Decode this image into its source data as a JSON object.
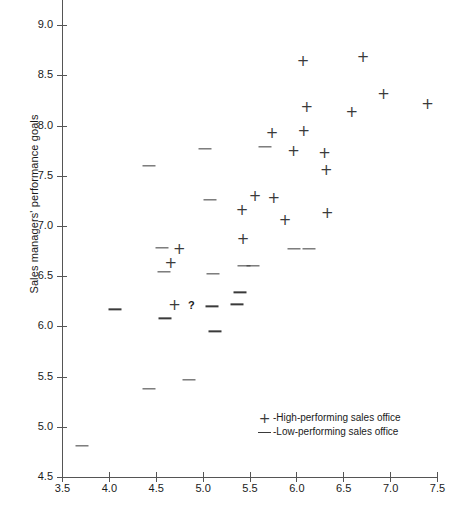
{
  "chart_data": {
    "type": "scatter",
    "title": "",
    "xlabel": "",
    "ylabel": "Sales managers' performance goals",
    "xlim": [
      3.5,
      7.5
    ],
    "ylim": [
      4.5,
      9.25
    ],
    "xticks": [
      "3.5",
      "4.0",
      "4.5",
      "5.0",
      "5.5",
      "6.0",
      "6.5",
      "7.0",
      "7.5"
    ],
    "xtick_values": [
      3.5,
      4.0,
      4.5,
      5.0,
      5.5,
      6.0,
      6.5,
      7.0,
      7.5
    ],
    "yticks": [
      "4.5",
      "5.0",
      "5.5",
      "6.0",
      "6.5",
      "7.0",
      "7.5",
      "8.0",
      "8.5",
      "9.0"
    ],
    "ytick_values": [
      4.5,
      5.0,
      5.5,
      6.0,
      6.5,
      7.0,
      7.5,
      8.0,
      8.5,
      9.0
    ],
    "grid": false,
    "legend_position": "lower-right",
    "annotations": [
      {
        "text": "?",
        "x": 4.78,
        "y": 6.21
      }
    ],
    "series": [
      {
        "name": "High-performing sales office",
        "marker": "+",
        "legend_label": "High-performing sales office",
        "points": [
          {
            "x": 4.66,
            "y": 6.63
          },
          {
            "x": 4.75,
            "y": 6.77
          },
          {
            "x": 4.7,
            "y": 6.21
          },
          {
            "x": 5.42,
            "y": 7.16
          },
          {
            "x": 5.43,
            "y": 6.87
          },
          {
            "x": 5.56,
            "y": 7.3
          },
          {
            "x": 5.74,
            "y": 7.93
          },
          {
            "x": 5.76,
            "y": 7.28
          },
          {
            "x": 5.88,
            "y": 7.06
          },
          {
            "x": 5.97,
            "y": 7.75
          },
          {
            "x": 6.07,
            "y": 8.64
          },
          {
            "x": 6.08,
            "y": 7.95
          },
          {
            "x": 6.11,
            "y": 8.18
          },
          {
            "x": 6.3,
            "y": 7.73
          },
          {
            "x": 6.32,
            "y": 7.56
          },
          {
            "x": 6.33,
            "y": 7.13
          },
          {
            "x": 6.59,
            "y": 8.13
          },
          {
            "x": 6.71,
            "y": 8.68
          },
          {
            "x": 6.93,
            "y": 8.31
          },
          {
            "x": 7.4,
            "y": 8.21
          }
        ]
      },
      {
        "name": "Low-performing sales office",
        "marker": "-",
        "legend_label": "Low-performing sales office",
        "points": [
          {
            "x": 3.71,
            "y": 4.81
          },
          {
            "x": 4.07,
            "y": 6.17
          },
          {
            "x": 4.43,
            "y": 5.38
          },
          {
            "x": 4.43,
            "y": 7.6
          },
          {
            "x": 4.57,
            "y": 6.78
          },
          {
            "x": 4.59,
            "y": 6.54
          },
          {
            "x": 4.6,
            "y": 6.08
          },
          {
            "x": 4.85,
            "y": 5.47
          },
          {
            "x": 5.03,
            "y": 7.77
          },
          {
            "x": 5.08,
            "y": 7.26
          },
          {
            "x": 5.11,
            "y": 6.52
          },
          {
            "x": 5.1,
            "y": 6.2
          },
          {
            "x": 5.13,
            "y": 5.95
          },
          {
            "x": 5.37,
            "y": 6.22
          },
          {
            "x": 5.4,
            "y": 6.34
          },
          {
            "x": 5.44,
            "y": 6.6
          },
          {
            "x": 5.54,
            "y": 6.6
          },
          {
            "x": 5.66,
            "y": 7.79
          },
          {
            "x": 5.97,
            "y": 6.77
          },
          {
            "x": 6.13,
            "y": 6.77
          }
        ]
      }
    ]
  },
  "legend": {
    "plus_symbol": "+",
    "dash_symbol": "–",
    "separator": "-",
    "rows": [
      {
        "symbol_name": "plus-marker-icon",
        "label": "-High-performing sales office"
      },
      {
        "symbol_name": "dash-marker-icon",
        "label": "-Low-performing sales office"
      }
    ]
  }
}
